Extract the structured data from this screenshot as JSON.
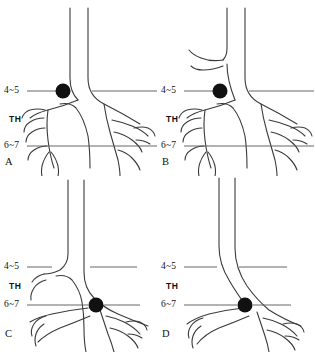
{
  "figure": {
    "background_color": "#ffffff",
    "line_color": "#3a3a3a",
    "reference_line_color": "#555555",
    "marker_color": "#111111",
    "panel_count": 4
  },
  "levels": {
    "upper_label": "4~5",
    "middle_label": "TH",
    "lower_label": "6~7"
  },
  "panels": [
    {
      "id": "A",
      "letter": "A",
      "upper_label": "4~5",
      "middle_label": "TH",
      "lower_label": "6~7",
      "marker_level": "4~5",
      "marker_side": "left",
      "marker_x": 63,
      "marker_y": 91,
      "marker_radius": 7.5,
      "structure": "full-branching"
    },
    {
      "id": "B",
      "letter": "B",
      "upper_label": "4~5",
      "middle_label": "TH",
      "lower_label": "6~7",
      "marker_level": "4~5",
      "marker_side": "left",
      "marker_x": 63,
      "marker_y": 91,
      "marker_radius": 7.5,
      "structure": "full-branching-upper-branch"
    },
    {
      "id": "C",
      "letter": "C",
      "upper_label": "4~5",
      "middle_label": "TH",
      "lower_label": "6~7",
      "marker_level": "6~7",
      "marker_side": "center",
      "marker_x": 96,
      "marker_y": 129,
      "marker_radius": 7.5,
      "structure": "full-branching"
    },
    {
      "id": "D",
      "letter": "D",
      "upper_label": "4~5",
      "middle_label": "TH",
      "lower_label": "6~7",
      "marker_level": "6~7",
      "marker_side": "center",
      "marker_x": 88,
      "marker_y": 129,
      "marker_radius": 7.5,
      "structure": "curved-simple"
    }
  ]
}
